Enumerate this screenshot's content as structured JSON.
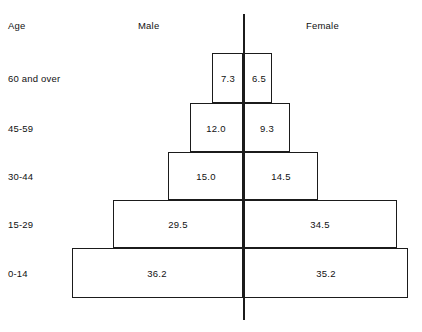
{
  "headers": {
    "age": "Age",
    "male": "Male",
    "female": "Female"
  },
  "chart_data": {
    "type": "bar",
    "title": "",
    "subtitle": "",
    "xlabel": "",
    "ylabel": "Age",
    "orientation": "horizontal-diverging",
    "grid": false,
    "legend_position": "top",
    "axis_center_label": "",
    "categories": [
      "60 and over",
      "45-59",
      "30-44",
      "15-29",
      "0-14"
    ],
    "series": [
      {
        "name": "Male",
        "values": [
          7.3,
          12.0,
          15.0,
          29.5,
          36.2
        ]
      },
      {
        "name": "Female",
        "values": [
          6.5,
          9.3,
          14.5,
          34.5,
          35.2
        ]
      }
    ],
    "value_labels": {
      "male": [
        "7.3",
        "12.0",
        "15.0",
        "29.5",
        "36.2"
      ],
      "female": [
        "6.5",
        "9.3",
        "14.5",
        "34.5",
        "35.2"
      ]
    },
    "colors": {
      "stroke": "#1b1b1b",
      "fill": "#ffffff",
      "text": "#111111",
      "background": "#ffffff"
    }
  },
  "rows": [
    {
      "age": "60 and over",
      "male_value": "7.3",
      "female_value": "6.5",
      "top": 53,
      "height": 50,
      "left": 212,
      "right": 272,
      "male_label_x": 228,
      "female_label_x": 259,
      "label_y": 78
    },
    {
      "age": "45-59",
      "male_value": "12.0",
      "female_value": "9.3",
      "top": 103,
      "height": 49,
      "left": 190,
      "right": 290,
      "male_label_x": 216,
      "female_label_x": 267,
      "label_y": 128
    },
    {
      "age": "30-44",
      "male_value": "15.0",
      "female_value": "14.5",
      "top": 152,
      "height": 48,
      "left": 168,
      "right": 318,
      "male_label_x": 206,
      "female_label_x": 281,
      "label_y": 176
    },
    {
      "age": "15-29",
      "male_value": "29.5",
      "female_value": "34.5",
      "top": 200,
      "height": 48,
      "left": 113,
      "right": 397,
      "male_label_x": 178,
      "female_label_x": 320,
      "label_y": 224
    },
    {
      "age": "0-14",
      "male_value": "36.2",
      "female_value": "35.2",
      "top": 248,
      "height": 50,
      "left": 72,
      "right": 408,
      "male_label_x": 157,
      "female_label_x": 326,
      "label_y": 273
    }
  ]
}
